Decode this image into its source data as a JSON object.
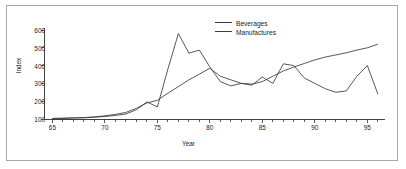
{
  "chart_data": {
    "type": "line",
    "title": "",
    "xlabel": "Year",
    "ylabel": "Index",
    "xlim": [
      64.2,
      96.3
    ],
    "ylim": [
      95,
      620
    ],
    "grid": false,
    "legend_position": "top-center-right",
    "xticks": [
      "65",
      "70",
      "75",
      "80",
      "85",
      "90",
      "95"
    ],
    "xtick_values": [
      65,
      70,
      75,
      80,
      85,
      90,
      95
    ],
    "yticks": [
      "100",
      "200",
      "300",
      "400",
      "500",
      "600"
    ],
    "ytick_values": [
      100,
      200,
      300,
      400,
      500,
      600
    ],
    "minor_xticks": true,
    "x": [
      65,
      66,
      67,
      68,
      69,
      70,
      71,
      72,
      73,
      74,
      75,
      76,
      77,
      78,
      79,
      80,
      81,
      82,
      83,
      84,
      85,
      86,
      87,
      88,
      89,
      90,
      91,
      92,
      93,
      94,
      95,
      96
    ],
    "series": [
      {
        "name": "Beverages",
        "color": "#3a3a3a",
        "values": [
          103,
          104,
          106,
          107,
          110,
          114,
          120,
          128,
          152,
          196,
          168,
          380,
          580,
          470,
          487,
          392,
          310,
          286,
          300,
          290,
          336,
          300,
          410,
          400,
          330,
          300,
          270,
          250,
          258,
          340,
          400,
          240
        ]
      },
      {
        "name": "Manufactures",
        "color": "#3a3a3a",
        "values": [
          103,
          104,
          106,
          108,
          112,
          118,
          126,
          137,
          160,
          190,
          205,
          245,
          282,
          320,
          352,
          385,
          340,
          320,
          300,
          296,
          310,
          340,
          370,
          392,
          412,
          432,
          448,
          460,
          472,
          487,
          500,
          520
        ]
      }
    ]
  },
  "legend": {
    "items": [
      {
        "label": "Beverages"
      },
      {
        "label": "Manufactures"
      }
    ]
  },
  "axes": {
    "xlabel": "Year",
    "ylabel": "Index"
  }
}
